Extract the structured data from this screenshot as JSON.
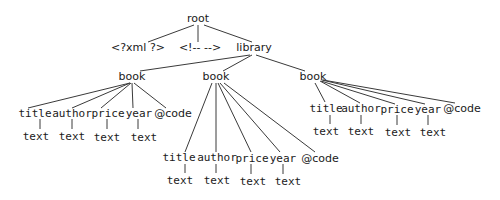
{
  "diagram": {
    "type": "tree",
    "title": "",
    "nodes": [
      {
        "id": "root",
        "label": "root",
        "x": 198,
        "y": 22
      },
      {
        "id": "xml",
        "label": "<?xml ?>",
        "x": 138,
        "y": 51
      },
      {
        "id": "comment",
        "label": "<!-- -->",
        "x": 200,
        "y": 51
      },
      {
        "id": "library",
        "label": "library",
        "x": 254,
        "y": 51
      },
      {
        "id": "book1",
        "label": "book",
        "x": 132,
        "y": 80
      },
      {
        "id": "book2",
        "label": "book",
        "x": 216,
        "y": 80
      },
      {
        "id": "book3",
        "label": "book",
        "x": 313,
        "y": 80
      },
      {
        "id": "b1_title",
        "label": "title",
        "x": 35,
        "y": 117
      },
      {
        "id": "b1_author",
        "label": "author",
        "x": 72,
        "y": 117
      },
      {
        "id": "b1_price",
        "label": "price",
        "x": 108,
        "y": 117
      },
      {
        "id": "b1_year",
        "label": "year",
        "x": 139,
        "y": 117
      },
      {
        "id": "b1_code",
        "label": "@code",
        "x": 173,
        "y": 117
      },
      {
        "id": "b1_title_t",
        "label": "text",
        "x": 36,
        "y": 140
      },
      {
        "id": "b1_author_t",
        "label": "text",
        "x": 72,
        "y": 140
      },
      {
        "id": "b1_price_t",
        "label": "text",
        "x": 107,
        "y": 141
      },
      {
        "id": "b1_year_t",
        "label": "text",
        "x": 144,
        "y": 141
      },
      {
        "id": "b2_title",
        "label": "title",
        "x": 179,
        "y": 161
      },
      {
        "id": "b2_author",
        "label": "author",
        "x": 217,
        "y": 161
      },
      {
        "id": "b2_price",
        "label": "price",
        "x": 252,
        "y": 162
      },
      {
        "id": "b2_year",
        "label": "year",
        "x": 283,
        "y": 162
      },
      {
        "id": "b2_code",
        "label": "@code",
        "x": 320,
        "y": 162
      },
      {
        "id": "b2_title_t",
        "label": "text",
        "x": 180,
        "y": 184
      },
      {
        "id": "b2_author_t",
        "label": "text",
        "x": 217,
        "y": 184
      },
      {
        "id": "b2_price_t",
        "label": "text",
        "x": 253,
        "y": 185
      },
      {
        "id": "b2_year_t",
        "label": "text",
        "x": 288,
        "y": 185
      },
      {
        "id": "b3_title",
        "label": "title",
        "x": 326,
        "y": 112
      },
      {
        "id": "b3_author",
        "label": "author",
        "x": 361,
        "y": 112
      },
      {
        "id": "b3_price",
        "label": "price",
        "x": 397,
        "y": 113
      },
      {
        "id": "b3_year",
        "label": "year",
        "x": 428,
        "y": 113
      },
      {
        "id": "b3_code",
        "label": "@code",
        "x": 462,
        "y": 112
      },
      {
        "id": "b3_title_t",
        "label": "text",
        "x": 326,
        "y": 135
      },
      {
        "id": "b3_author_t",
        "label": "text",
        "x": 361,
        "y": 135
      },
      {
        "id": "b3_price_t",
        "label": "text",
        "x": 398,
        "y": 136
      },
      {
        "id": "b3_year_t",
        "label": "text",
        "x": 433,
        "y": 136
      }
    ],
    "edges": [
      {
        "from": "root",
        "to": "xml",
        "x1": 194,
        "y1": 25,
        "x2": 148,
        "y2": 42
      },
      {
        "from": "root",
        "to": "comment",
        "x1": 198,
        "y1": 25,
        "x2": 198,
        "y2": 42
      },
      {
        "from": "root",
        "to": "library",
        "x1": 204,
        "y1": 25,
        "x2": 252,
        "y2": 42
      },
      {
        "from": "library",
        "to": "book1",
        "x1": 250,
        "y1": 55,
        "x2": 140,
        "y2": 71
      },
      {
        "from": "library",
        "to": "book2",
        "x1": 252,
        "y1": 55,
        "x2": 223,
        "y2": 71
      },
      {
        "from": "library",
        "to": "book3",
        "x1": 256,
        "y1": 55,
        "x2": 305,
        "y2": 71
      },
      {
        "from": "book1",
        "to": "b1_title",
        "x1": 130,
        "y1": 83,
        "x2": 28,
        "y2": 108
      },
      {
        "from": "book1",
        "to": "b1_author",
        "x1": 130,
        "y1": 83,
        "x2": 72,
        "y2": 108
      },
      {
        "from": "book1",
        "to": "b1_price",
        "x1": 131,
        "y1": 83,
        "x2": 101,
        "y2": 108
      },
      {
        "from": "book1",
        "to": "b1_year",
        "x1": 132,
        "y1": 83,
        "x2": 133,
        "y2": 108
      },
      {
        "from": "book1",
        "to": "b1_code",
        "x1": 134,
        "y1": 83,
        "x2": 166,
        "y2": 108
      },
      {
        "from": "b1_title",
        "to": "b1_title_t",
        "x1": 40,
        "y1": 119,
        "x2": 40,
        "y2": 129
      },
      {
        "from": "b1_author",
        "to": "b1_author_t",
        "x1": 72,
        "y1": 119,
        "x2": 72,
        "y2": 129
      },
      {
        "from": "b1_price",
        "to": "b1_price_t",
        "x1": 107,
        "y1": 119,
        "x2": 107,
        "y2": 129
      },
      {
        "from": "b1_year",
        "to": "b1_year_t",
        "x1": 138,
        "y1": 119,
        "x2": 138,
        "y2": 129
      },
      {
        "from": "book2",
        "to": "b2_title",
        "x1": 212,
        "y1": 83,
        "x2": 185,
        "y2": 152
      },
      {
        "from": "book2",
        "to": "b2_author",
        "x1": 216,
        "y1": 83,
        "x2": 216,
        "y2": 152
      },
      {
        "from": "book2",
        "to": "b2_price",
        "x1": 218,
        "y1": 83,
        "x2": 251,
        "y2": 152
      },
      {
        "from": "book2",
        "to": "b2_year",
        "x1": 220,
        "y1": 83,
        "x2": 280,
        "y2": 152
      },
      {
        "from": "book2",
        "to": "b2_code",
        "x1": 224,
        "y1": 83,
        "x2": 315,
        "y2": 152
      },
      {
        "from": "b2_title",
        "to": "b2_title_t",
        "x1": 185,
        "y1": 164,
        "x2": 185,
        "y2": 173
      },
      {
        "from": "b2_author",
        "to": "b2_author_t",
        "x1": 216,
        "y1": 164,
        "x2": 216,
        "y2": 173
      },
      {
        "from": "b2_price",
        "to": "b2_price_t",
        "x1": 251,
        "y1": 164,
        "x2": 251,
        "y2": 174
      },
      {
        "from": "b2_year",
        "to": "b2_year_t",
        "x1": 283,
        "y1": 164,
        "x2": 283,
        "y2": 174
      },
      {
        "from": "book3",
        "to": "b3_title",
        "x1": 315,
        "y1": 83,
        "x2": 325,
        "y2": 102
      },
      {
        "from": "book3",
        "to": "b3_author",
        "x1": 320,
        "y1": 81,
        "x2": 360,
        "y2": 103
      },
      {
        "from": "book3",
        "to": "b3_price",
        "x1": 321,
        "y1": 81,
        "x2": 395,
        "y2": 104
      },
      {
        "from": "book3",
        "to": "b3_year",
        "x1": 322,
        "y1": 80,
        "x2": 425,
        "y2": 104
      },
      {
        "from": "book3",
        "to": "b3_code",
        "x1": 323,
        "y1": 80,
        "x2": 455,
        "y2": 103
      },
      {
        "from": "b3_title",
        "to": "b3_title_t",
        "x1": 330,
        "y1": 115,
        "x2": 330,
        "y2": 124
      },
      {
        "from": "b3_author",
        "to": "b3_author_t",
        "x1": 361,
        "y1": 115,
        "x2": 361,
        "y2": 124
      },
      {
        "from": "b3_price",
        "to": "b3_price_t",
        "x1": 397,
        "y1": 115,
        "x2": 397,
        "y2": 125
      },
      {
        "from": "b3_year",
        "to": "b3_year_t",
        "x1": 428,
        "y1": 115,
        "x2": 428,
        "y2": 125
      }
    ]
  }
}
